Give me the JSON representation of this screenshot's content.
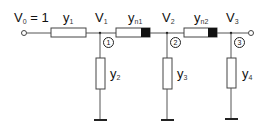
{
  "diagram": {
    "source_label": {
      "main": "V",
      "sub": "0",
      "suffix": " = 1"
    },
    "series_elements": [
      {
        "main": "y",
        "sub": "1"
      },
      {
        "main": "y",
        "sub": "n1"
      },
      {
        "main": "y",
        "sub": "n2"
      }
    ],
    "node_voltages": [
      {
        "main": "V",
        "sub": "1"
      },
      {
        "main": "V",
        "sub": "2"
      },
      {
        "main": "V",
        "sub": "3"
      }
    ],
    "shunt_elements": [
      {
        "main": "y",
        "sub": "2"
      },
      {
        "main": "y",
        "sub": "3"
      },
      {
        "main": "y",
        "sub": "4"
      }
    ],
    "node_numbers": [
      "1",
      "2",
      "3"
    ],
    "colors": {
      "line": "#555555",
      "box_fill": "#ffffff",
      "block": "#111111"
    }
  }
}
